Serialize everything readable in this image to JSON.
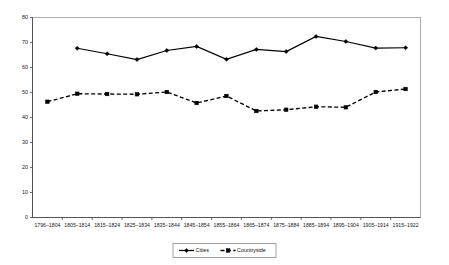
{
  "chart_data": {
    "type": "line",
    "title": "",
    "subtitle": "",
    "xlabel": "",
    "ylabel": "",
    "ylim": [
      0,
      80
    ],
    "ytick_step": 10,
    "yticks": [
      "0",
      "10",
      "20",
      "30",
      "40",
      "50",
      "60",
      "70",
      "80"
    ],
    "grid": false,
    "legend_position": "bottom-center",
    "categories": [
      "1796–1804",
      "1805–1814",
      "1815–1824",
      "1825–1834",
      "1835–1844",
      "1845–1854",
      "1855–1864",
      "1865–1874",
      "1875–1884",
      "1885–1894",
      "1895–1904",
      "1905–1914",
      "1915–1922"
    ],
    "series": [
      {
        "name": "Cities",
        "marker": "diamond",
        "linestyle": "solid",
        "color": "#000000",
        "values": [
          null,
          67.7,
          65.5,
          63.2,
          66.8,
          68.4,
          63.3,
          67.2,
          66.4,
          72.4,
          70.4,
          67.8,
          67.9
        ]
      },
      {
        "name": "Countryside",
        "marker": "square",
        "linestyle": "dashed",
        "color": "#000000",
        "values": [
          46.3,
          49.5,
          49.4,
          49.3,
          50.2,
          45.8,
          48.6,
          42.6,
          43.1,
          44.3,
          44.1,
          50.2,
          51.4
        ]
      }
    ]
  },
  "legend": {
    "items": [
      {
        "label": "Cities"
      },
      {
        "label": "Countryside"
      }
    ]
  },
  "colors": {
    "ink": "#000000",
    "plot_border": "#9a9a9a",
    "axis": "#4a4a4a",
    "background": "#ffffff"
  }
}
